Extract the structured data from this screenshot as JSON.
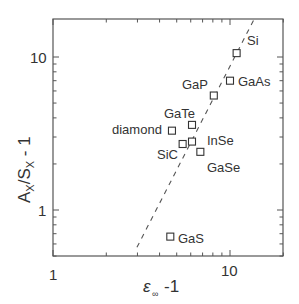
{
  "chart_data": {
    "type": "scatter",
    "title": "",
    "xlabel": "ε∞ -1",
    "ylabel": "AX/SX - 1",
    "xscale": "log",
    "yscale": "log",
    "xlim": [
      1,
      20
    ],
    "ylim": [
      0.5,
      18
    ],
    "grid": false,
    "legend": null,
    "x_tick_labels": [
      "1",
      "10"
    ],
    "y_tick_labels": [
      "1",
      "10"
    ],
    "points": [
      {
        "label": "Si",
        "x": 10.9,
        "y": 10.6
      },
      {
        "label": "GaAs",
        "x": 10.0,
        "y": 7.0
      },
      {
        "label": "GaP",
        "x": 8.1,
        "y": 5.6
      },
      {
        "label": "GaTe",
        "x": 6.1,
        "y": 3.6
      },
      {
        "label": "diamond",
        "x": 4.7,
        "y": 3.3
      },
      {
        "label": "SiC",
        "x": 5.4,
        "y": 2.7
      },
      {
        "label": "InSe",
        "x": 6.1,
        "y": 2.8
      },
      {
        "label": "GaSe",
        "x": 6.8,
        "y": 2.4
      },
      {
        "label": "GaS",
        "x": 4.6,
        "y": 0.67
      }
    ],
    "fit_line": {
      "style": "dashed",
      "x": [
        2.98,
        13.7
      ],
      "y": [
        0.57,
        17.7
      ],
      "slope_loglog": 2.25
    }
  },
  "colors": {
    "axis": "#555555",
    "marker": "#333333",
    "line": "#555555",
    "text": "#333333"
  }
}
